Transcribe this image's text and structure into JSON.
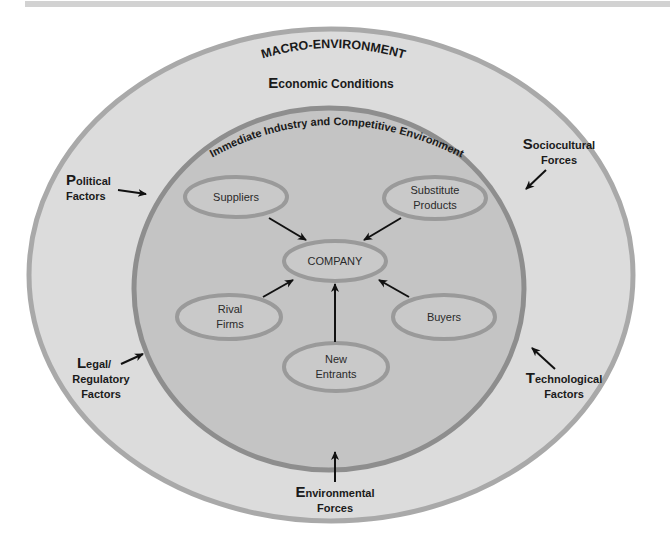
{
  "diagram": {
    "type": "nested-ellipse-environment-diagram",
    "colors": {
      "outer_fill": "#dcdcdc",
      "outer_stroke": "#a9a9a9",
      "inner_fill": "#c4c4c4",
      "inner_stroke": "#8e8e8e",
      "node_fill": "#c9c9c9",
      "node_stroke": "#9a9a9a",
      "arrow": "#111111",
      "text": "#1a1a1a"
    },
    "outer": {
      "title": "MACRO-ENVIRONMENT",
      "factors": [
        {
          "id": "economic",
          "initial": "E",
          "line1_rest": "conomic Conditions",
          "line2": ""
        },
        {
          "id": "political",
          "initial": "P",
          "line1_rest": "olitical",
          "line2": "Factors"
        },
        {
          "id": "sociocultural",
          "initial": "S",
          "line1_rest": "ociocultural",
          "line2": "Forces"
        },
        {
          "id": "legal",
          "initial": "L",
          "line1_rest": "egal/",
          "line2": "Regulatory",
          "line3": "Factors"
        },
        {
          "id": "technological",
          "initial": "T",
          "line1_rest": "echnological",
          "line2": "Factors"
        },
        {
          "id": "environmental",
          "initial": "E",
          "line1_rest": "nvironmental",
          "line2": "Forces"
        }
      ]
    },
    "inner": {
      "title": "Immediate Industry and Competitive Environment",
      "center_node": "COMPANY",
      "nodes": [
        {
          "id": "suppliers",
          "line1": "Suppliers",
          "line2": ""
        },
        {
          "id": "substitutes",
          "line1": "Substitute",
          "line2": "Products"
        },
        {
          "id": "rivals",
          "line1": "Rival",
          "line2": "Firms"
        },
        {
          "id": "buyers",
          "line1": "Buyers",
          "line2": ""
        },
        {
          "id": "new_entrants",
          "line1": "New",
          "line2": "Entrants"
        }
      ]
    },
    "edges": [
      {
        "from": "Suppliers",
        "to": "COMPANY"
      },
      {
        "from": "Substitute Products",
        "to": "COMPANY"
      },
      {
        "from": "Rival Firms",
        "to": "COMPANY"
      },
      {
        "from": "Buyers",
        "to": "COMPANY"
      },
      {
        "from": "New Entrants",
        "to": "COMPANY"
      },
      {
        "from": "Political Factors",
        "to": "Immediate Industry and Competitive Environment"
      },
      {
        "from": "Sociocultural Forces",
        "to": "Immediate Industry and Competitive Environment"
      },
      {
        "from": "Legal/Regulatory Factors",
        "to": "Immediate Industry and Competitive Environment"
      },
      {
        "from": "Technological Factors",
        "to": "Immediate Industry and Competitive Environment"
      },
      {
        "from": "Environmental Forces",
        "to": "Immediate Industry and Competitive Environment"
      }
    ]
  }
}
